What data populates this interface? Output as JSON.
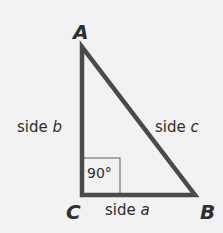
{
  "diagram": {
    "colors": {
      "background": "#f2f2f2",
      "stroke": "#4a4a4a",
      "box": "#777777",
      "text": "#2e2e2e"
    },
    "vertices": [
      {
        "label": "A",
        "x": 82,
        "y": 47
      },
      {
        "label": "C",
        "x": 82,
        "y": 195
      },
      {
        "label": "B",
        "x": 195,
        "y": 195
      }
    ],
    "sides": {
      "b": {
        "word": "side",
        "var": "b"
      },
      "c": {
        "word": "side",
        "var": "c"
      },
      "a": {
        "word": "side",
        "var": "a"
      }
    },
    "right_angle": {
      "label": "90°",
      "vertex": "C"
    }
  }
}
